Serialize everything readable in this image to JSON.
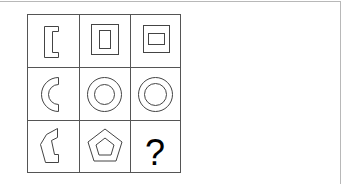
{
  "puzzle": {
    "rows": 3,
    "cols": 3,
    "cells": [
      {
        "row": 0,
        "col": 0,
        "shape": "bracket-outline",
        "description": "left bracket shape [ outline"
      },
      {
        "row": 0,
        "col": 1,
        "shape": "nested-rectangles-vertical",
        "description": "square with inner vertical rectangle"
      },
      {
        "row": 0,
        "col": 2,
        "shape": "nested-rectangles-horizontal",
        "description": "square with inner horizontal rectangle"
      },
      {
        "row": 1,
        "col": 0,
        "shape": "crescent-outline",
        "description": "half ring / C shape outline"
      },
      {
        "row": 1,
        "col": 1,
        "shape": "concentric-circles",
        "description": "two concentric circles"
      },
      {
        "row": 1,
        "col": 2,
        "shape": "concentric-circles",
        "description": "two concentric circles"
      },
      {
        "row": 2,
        "col": 0,
        "shape": "half-pentagon-outline",
        "description": "partial pentagon outline"
      },
      {
        "row": 2,
        "col": 1,
        "shape": "nested-pentagons",
        "description": "pentagon with inner pentagon"
      },
      {
        "row": 2,
        "col": 2,
        "shape": "question-mark",
        "label": "?"
      }
    ]
  },
  "colors": {
    "grid_line": "#555555",
    "shape_stroke": "#444444",
    "frame": "#b8b8b8",
    "question_mark": "#000000"
  }
}
